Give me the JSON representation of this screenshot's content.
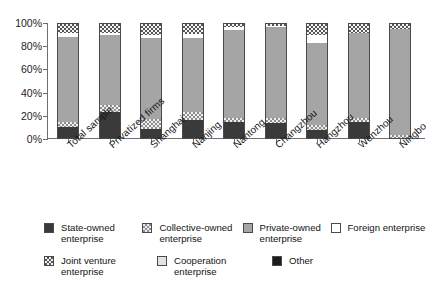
{
  "chart_data": {
    "type": "bar",
    "subtype": "stacked-100-percent",
    "title": "",
    "xlabel": "",
    "ylabel": "",
    "ylim": [
      0,
      100
    ],
    "ytick_labels": [
      "0%",
      "20%",
      "40%",
      "60%",
      "80%",
      "100%"
    ],
    "ytick_values": [
      0,
      20,
      40,
      60,
      80,
      100
    ],
    "grid": false,
    "legend_position": "bottom",
    "categories": [
      "Total sample",
      "Privatized firms",
      "Shanghai",
      "Nanjing",
      "Nantong",
      "Changzhou",
      "Hangzhou",
      "Wenzhou",
      "Ningbo"
    ],
    "series": [
      {
        "name": "State-owned enterprise",
        "fill": "f-state",
        "color": "#3a3a3a",
        "values": [
          10,
          23,
          8,
          16,
          14,
          13,
          7,
          14,
          0
        ]
      },
      {
        "name": "Collective-owned enterprise",
        "fill": "f-collective",
        "color": "#8e8e8e",
        "values": [
          4,
          6,
          9,
          7,
          4,
          5,
          4,
          4,
          3
        ]
      },
      {
        "name": "Private-owned enterprise",
        "fill": "f-private",
        "color": "#a5a5a5",
        "values": [
          75,
          61,
          71,
          65,
          77,
          79,
          72,
          74,
          93
        ]
      },
      {
        "name": "Foreign enterprise",
        "fill": "f-foreign",
        "color": "#ffffff",
        "values": [
          3,
          2,
          2,
          3,
          2,
          1,
          7,
          0,
          0
        ]
      },
      {
        "name": "Joint venture enterprise",
        "fill": "f-joint",
        "color": "#555555",
        "values": [
          8,
          8,
          10,
          9,
          3,
          2,
          10,
          8,
          4
        ]
      },
      {
        "name": "Cooperation enterprise",
        "fill": "f-coop",
        "color": "#e2e2e2",
        "values": [
          0,
          0,
          0,
          0,
          0,
          0,
          0,
          0,
          0
        ]
      },
      {
        "name": "Other",
        "fill": "f-other",
        "color": "#1c1c1c",
        "values": [
          0,
          0,
          0,
          0,
          0,
          0,
          0,
          0,
          0
        ]
      }
    ]
  },
  "axis": {
    "y_ticks": [
      {
        "label": "100%",
        "value": 100
      },
      {
        "label": "80%",
        "value": 80
      },
      {
        "label": "60%",
        "value": 60
      },
      {
        "label": "40%",
        "value": 40
      },
      {
        "label": "20%",
        "value": 20
      },
      {
        "label": "0%",
        "value": 0
      }
    ]
  },
  "legend": {
    "row1": [
      {
        "label": "State-owned enterprise",
        "fill": "f-state"
      },
      {
        "label": "Collective-owned enterprise",
        "fill": "f-collective"
      },
      {
        "label": "Private-owned enterprise",
        "fill": "f-private"
      },
      {
        "label": "Foreign enterprise",
        "fill": "f-foreign"
      }
    ],
    "row2": [
      {
        "label": "Joint venture enterprise",
        "fill": "f-joint"
      },
      {
        "label": "Cooperation enterprise",
        "fill": "f-coop"
      },
      {
        "label": "Other",
        "fill": "f-other"
      }
    ]
  }
}
